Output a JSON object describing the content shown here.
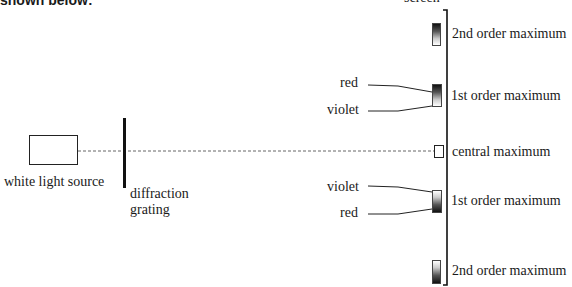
{
  "intro_text": "shown below:",
  "labels": {
    "screen": "screen",
    "source": "white light source",
    "grating_line1": "diffraction",
    "grating_line2": "grating",
    "second_order_top": "2nd order maximum",
    "first_order_top": "1st order maximum",
    "central": "central maximum",
    "first_order_bottom": "1st order maximum",
    "second_order_bottom": "2nd order maximum",
    "red_top": "red",
    "violet_top": "violet",
    "violet_bottom": "violet",
    "red_bottom": "red"
  },
  "colors": {
    "line": "#1a1a1a",
    "dashed": "#666666"
  }
}
